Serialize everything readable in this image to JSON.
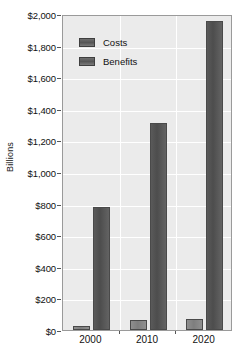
{
  "chart_data": {
    "type": "bar",
    "title": "",
    "xlabel": "",
    "ylabel": "Billions",
    "categories": [
      "2000",
      "2010",
      "2020"
    ],
    "series": [
      {
        "name": "Costs",
        "values": [
          25,
          65,
          70
        ]
      },
      {
        "name": "Benefits",
        "values": [
          780,
          1310,
          1955
        ]
      }
    ],
    "ylim": [
      0,
      2000
    ],
    "ytick_values": [
      0,
      200,
      400,
      600,
      800,
      1000,
      1200,
      1400,
      1600,
      1800,
      2000
    ],
    "ytick_labels": [
      "$0",
      "$200",
      "$400",
      "$600",
      "$800",
      "$1,000",
      "$1,200",
      "$1,400",
      "$1,600",
      "$1,800",
      "$2,000"
    ],
    "grid": true,
    "legend_position": "upper-left-inside",
    "colors": {
      "costs": "#7e7e7e",
      "benefits": "#4d4d4d",
      "plot_background": "#ebebeb",
      "gridline": "#ffffff",
      "axis": "#9a9a9a",
      "text": "#111111"
    }
  },
  "legend": {
    "items": [
      {
        "label": "Costs"
      },
      {
        "label": "Benefits"
      }
    ]
  },
  "axes": {
    "y_title": "Billions"
  }
}
